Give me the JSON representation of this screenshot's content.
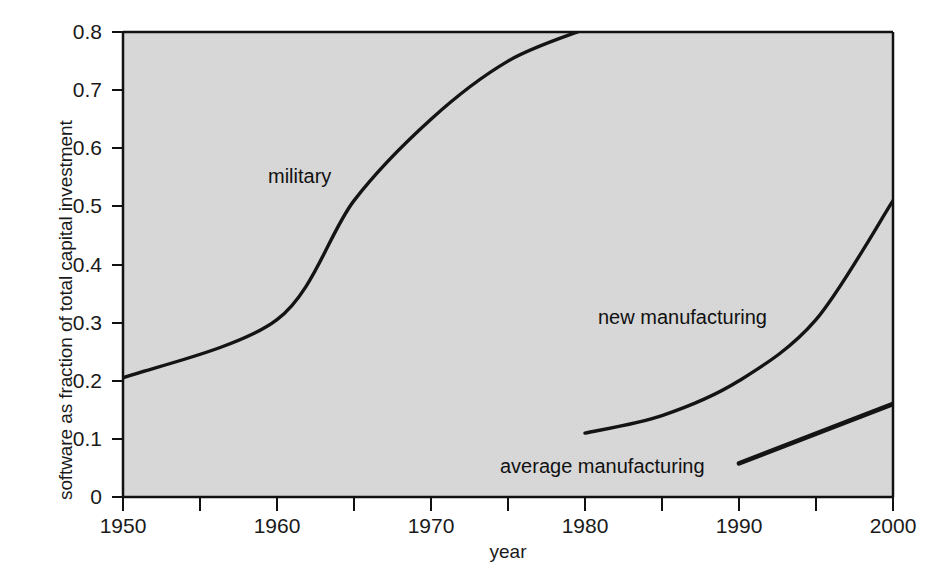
{
  "chart_data": {
    "type": "line",
    "title": "",
    "xlabel": "year",
    "ylabel": "software as fraction of total capital investment",
    "xlim": [
      1950,
      2000
    ],
    "ylim": [
      0,
      0.8
    ],
    "grid": false,
    "legend_position": "inline-annotations",
    "background_color": "#d8d8d8",
    "line_color": "#111111",
    "xticks": [
      1950,
      1960,
      1970,
      1980,
      1990,
      2000
    ],
    "xtick_labels": [
      "1950",
      "1960",
      "1970",
      "1980",
      "1990",
      "2000"
    ],
    "xminorticks": [
      1955,
      1965,
      1975,
      1985,
      1995
    ],
    "yticks": [
      0,
      0.1,
      0.2,
      0.3,
      0.4,
      0.5,
      0.6,
      0.7,
      0.8
    ],
    "ytick_labels": [
      "0",
      "0.1",
      "0.2",
      "0.3",
      "0.4",
      "0.5",
      "0.6",
      "0.7",
      "0.8"
    ],
    "series": [
      {
        "name": "military",
        "label": "military",
        "x": [
          1950,
          1960,
          1965,
          1970,
          1975,
          1980
        ],
        "values": [
          0.205,
          0.305,
          0.51,
          0.65,
          0.75,
          0.805
        ],
        "note": "rises off the top of the plot area at 1980"
      },
      {
        "name": "new manufacturing",
        "label": "new manufacturing",
        "x": [
          1980,
          1985,
          1990,
          1995,
          2000
        ],
        "values": [
          0.11,
          0.14,
          0.2,
          0.305,
          0.51
        ]
      },
      {
        "name": "average manufacturing",
        "label": "average manufacturing",
        "x": [
          1990,
          2000
        ],
        "values": [
          0.058,
          0.16
        ]
      }
    ],
    "annotations": [
      {
        "text": "military",
        "x": 1967,
        "y": 0.555
      },
      {
        "text": "new manufacturing",
        "x": 1984.5,
        "y": 0.305
      },
      {
        "text": "average manufacturing",
        "x": 1983,
        "y": 0.055
      }
    ]
  },
  "axes": {
    "x_title": "year",
    "y_title": "software as fraction of total capital investment"
  }
}
